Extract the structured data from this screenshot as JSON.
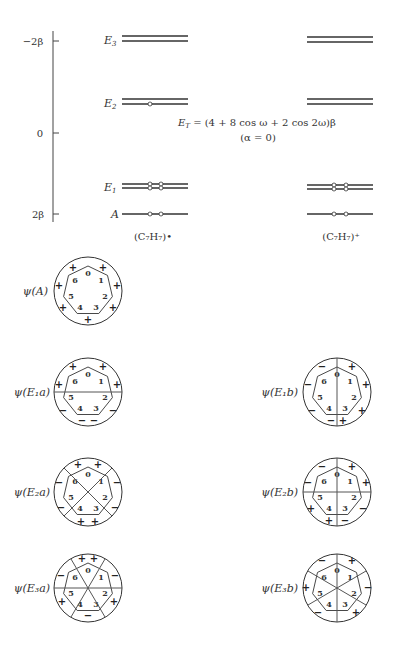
{
  "energy_diagram": {
    "axis_ticks": [
      "−2β",
      "0",
      "2β"
    ],
    "levels": [
      "E3",
      "E2",
      "E1",
      "A"
    ],
    "level_labels": {
      "E3": "E",
      "E3_sub": "3",
      "E2": "E",
      "E2_sub": "2",
      "E1": "E",
      "E1_sub": "1",
      "A": "A"
    },
    "formula_line1": "E",
    "formula_sub": "T",
    "formula_rest": " = (4 + 8 cos ω + 2 cos 2ω)β",
    "formula_line2": "(α = 0)",
    "left_species": "(C₇H₇)•",
    "right_species": "(C₇H₇)⁺"
  },
  "orbitals": [
    {
      "label": "ψ(A)",
      "signs": "all +"
    },
    {
      "label": "ψ(E₁a)"
    },
    {
      "label": "ψ(E₁b)"
    },
    {
      "label": "ψ(E₂a)"
    },
    {
      "label": "ψ(E₂b)"
    },
    {
      "label": "ψ(E₃a)"
    },
    {
      "label": "ψ(E₃b)"
    }
  ],
  "vertex_numbers": [
    "0",
    "1",
    "2",
    "3",
    "4",
    "5",
    "6"
  ]
}
